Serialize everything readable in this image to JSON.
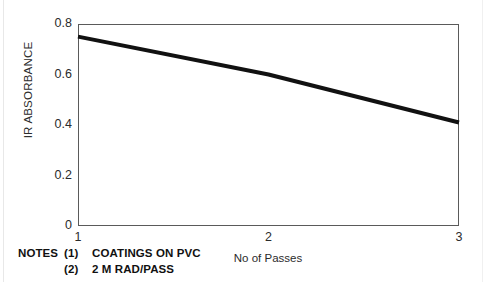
{
  "figure": {
    "background": "#ffffff",
    "frame_color": "#5a5a5a"
  },
  "chart_data": {
    "type": "line",
    "title": "",
    "xlabel": "No of Passes",
    "ylabel": "IR ABSORBANCE",
    "x": [
      1,
      2,
      3
    ],
    "series": [
      {
        "name": "IR absorbance vs passes",
        "values": [
          0.75,
          0.6,
          0.41
        ],
        "color": "#111111",
        "line_width": 4
      }
    ],
    "xlim": [
      1,
      3
    ],
    "ylim": [
      0,
      0.8
    ],
    "xticks": [
      1,
      2,
      3
    ],
    "xtick_labels": [
      "1",
      "2",
      "3"
    ],
    "yticks": [
      0,
      0.2,
      0.4,
      0.6,
      0.8
    ],
    "ytick_labels": [
      "0",
      "0.2",
      "0.4",
      "0.6",
      "0.8"
    ],
    "grid": false,
    "legend": false,
    "legend_position": "none",
    "annotations": [
      "NOTES (1) COATINGS ON PVC",
      "(2) 2 M RAD/PASS"
    ]
  },
  "notes": {
    "lead": "NOTES",
    "rows": [
      {
        "num": "(1)",
        "text": "COATINGS ON PVC"
      },
      {
        "num": "(2)",
        "text": "2 M RAD/PASS"
      }
    ]
  }
}
